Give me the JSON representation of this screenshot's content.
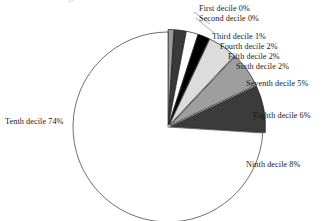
{
  "chart_data": {
    "type": "pie",
    "title": "",
    "subtitle": "",
    "xlabel": "",
    "ylabel": "",
    "legend_position": "outside-labels",
    "grid": false,
    "start_angle_deg": 0,
    "direction": "clockwise",
    "center": {
      "x": 168,
      "y": 127
    },
    "radius": 95,
    "categories": [
      "First decile",
      "Second decile",
      "Third decile",
      "Fourth decile",
      "Fifth decile",
      "Sixth decile",
      "Seventh decile",
      "Eighth decile",
      "Ninth decile",
      "Tenth decile"
    ],
    "values": [
      0,
      0,
      1,
      2,
      2,
      2,
      5,
      6,
      8,
      74
    ],
    "value_unit": "%",
    "slice_colors": [
      "#8c8c8c",
      "#8c8c8c",
      "#9a9a9a",
      "#3a3a3a",
      "#ffffff",
      "#000000",
      "#dcdcdc",
      "#9e9e9e",
      "#3b3b3b",
      "#ffffff"
    ],
    "slice_stroke": "#1a1a1a",
    "outline_color": "#4a4a4a",
    "data_labels": [
      "First decile 0%",
      "Second decile 0%",
      "Third decile 1%",
      "Fourth decile 2%",
      "Fifth decile 2%",
      "Sixth decile 2%",
      "Seventh decile 5%",
      "Eighth decile 6%",
      "Ninth decile 8%",
      "Tenth decile 74%"
    ]
  },
  "labels": {
    "first_decile": "First decile 0%",
    "second_decile": "Second decile 0%",
    "third_decile": "Third decile 1%",
    "fourth_decile": "Fourth decile 2%",
    "fifth_decile": "Fifth decile 2%",
    "sixth_decile": "Sixth decile 2%",
    "seventh_decile": "Seventh decile 5%",
    "eighth_decile": "Eighth decile 6%",
    "ninth_decile": "Ninth decile 8%",
    "tenth_decile": "Tenth decile 74%"
  }
}
